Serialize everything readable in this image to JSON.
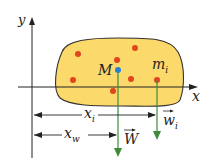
{
  "diagram": {
    "axis_x_label": "x",
    "axis_y_label": "y",
    "center_label": "M",
    "mass_label": "m",
    "mass_sub": "i",
    "xi_label": "x",
    "xi_sub": "i",
    "xw_label": "x",
    "xw_sub": "w",
    "W_label": "W",
    "wi_label": "w",
    "wi_sub": "i",
    "colors": {
      "body_fill": "#fbd96a",
      "body_stroke": "#333333",
      "dots": "#e2451e",
      "center": "#2a7fd4",
      "weight_arrows": "#3f8a3a",
      "axes": "#222222"
    }
  }
}
